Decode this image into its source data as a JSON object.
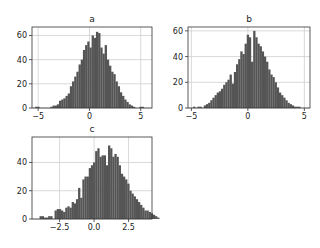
{
  "figure": {
    "width": 320,
    "height": 248,
    "bar_color": "#555555",
    "grid_color": "#cfcfcf",
    "frame_color": "#333333"
  },
  "chart_data": [
    {
      "type": "bar",
      "title": "a",
      "xlabel": "",
      "ylabel": "",
      "frame": {
        "left": 32,
        "top": 27,
        "right": 152,
        "bottom": 108
      },
      "xlim": [
        -5.6,
        6.1
      ],
      "ylim": [
        0,
        67
      ],
      "xticks": [
        -5,
        0,
        5
      ],
      "xtick_labels": [
        "-5",
        "0",
        "5"
      ],
      "yticks": [
        0,
        20,
        40,
        60
      ],
      "ytick_labels": [
        "0",
        "20",
        "40",
        "60"
      ],
      "grid": true,
      "bin_edges_start": -5.3,
      "bin_width": 0.212,
      "values": [
        1,
        1,
        0,
        0,
        0,
        0,
        0,
        1,
        2,
        2,
        3,
        6,
        7,
        8,
        10,
        12,
        18,
        22,
        26,
        30,
        36,
        40,
        48,
        52,
        55,
        50,
        60,
        58,
        63,
        62,
        50,
        45,
        52,
        40,
        35,
        30,
        28,
        22,
        18,
        13,
        10,
        7,
        5,
        3,
        2,
        1,
        0,
        0,
        1,
        1
      ]
    },
    {
      "type": "bar",
      "title": "b",
      "xlabel": "",
      "ylabel": "",
      "frame": {
        "left": 188,
        "top": 27,
        "right": 310,
        "bottom": 108
      },
      "xlim": [
        -5.3,
        5.5
      ],
      "ylim": [
        0,
        63
      ],
      "xticks": [
        -5,
        0,
        5
      ],
      "xtick_labels": [
        "-5",
        "0",
        "5"
      ],
      "yticks": [
        0,
        20,
        40,
        60
      ],
      "ytick_labels": [
        "0",
        "20",
        "40",
        "60"
      ],
      "grid": true,
      "bin_edges_start": -4.85,
      "bin_width": 0.19,
      "values": [
        1,
        0,
        1,
        1,
        0,
        2,
        3,
        4,
        6,
        8,
        10,
        12,
        13,
        15,
        18,
        20,
        22,
        26,
        19,
        28,
        34,
        38,
        44,
        42,
        50,
        57,
        55,
        36,
        60,
        55,
        50,
        48,
        44,
        40,
        36,
        30,
        26,
        24,
        20,
        16,
        12,
        10,
        8,
        6,
        4,
        3,
        2,
        1,
        1,
        1
      ]
    },
    {
      "type": "bar",
      "title": "c",
      "xlabel": "",
      "ylabel": "",
      "frame": {
        "left": 32,
        "top": 137,
        "right": 152,
        "bottom": 219
      },
      "xlim": [
        -4.5,
        4.2
      ],
      "ylim": [
        0,
        58
      ],
      "xticks": [
        -2.5,
        0.0,
        2.5
      ],
      "xtick_labels": [
        "-2.5",
        "0.0",
        "2.5"
      ],
      "yticks": [
        0,
        20,
        40
      ],
      "ytick_labels": [
        "0",
        "20",
        "40"
      ],
      "grid": true,
      "bin_edges_start": -3.95,
      "bin_width": 0.155,
      "values": [
        2,
        2,
        1,
        1,
        2,
        2,
        0,
        6,
        7,
        7,
        6,
        5,
        8,
        9,
        8,
        12,
        11,
        14,
        22,
        15,
        28,
        30,
        30,
        36,
        38,
        40,
        48,
        50,
        44,
        45,
        45,
        38,
        52,
        50,
        44,
        46,
        44,
        38,
        32,
        30,
        28,
        25,
        20,
        18,
        16,
        14,
        12,
        10,
        8,
        6,
        6,
        5,
        4,
        3,
        2,
        1
      ]
    }
  ]
}
